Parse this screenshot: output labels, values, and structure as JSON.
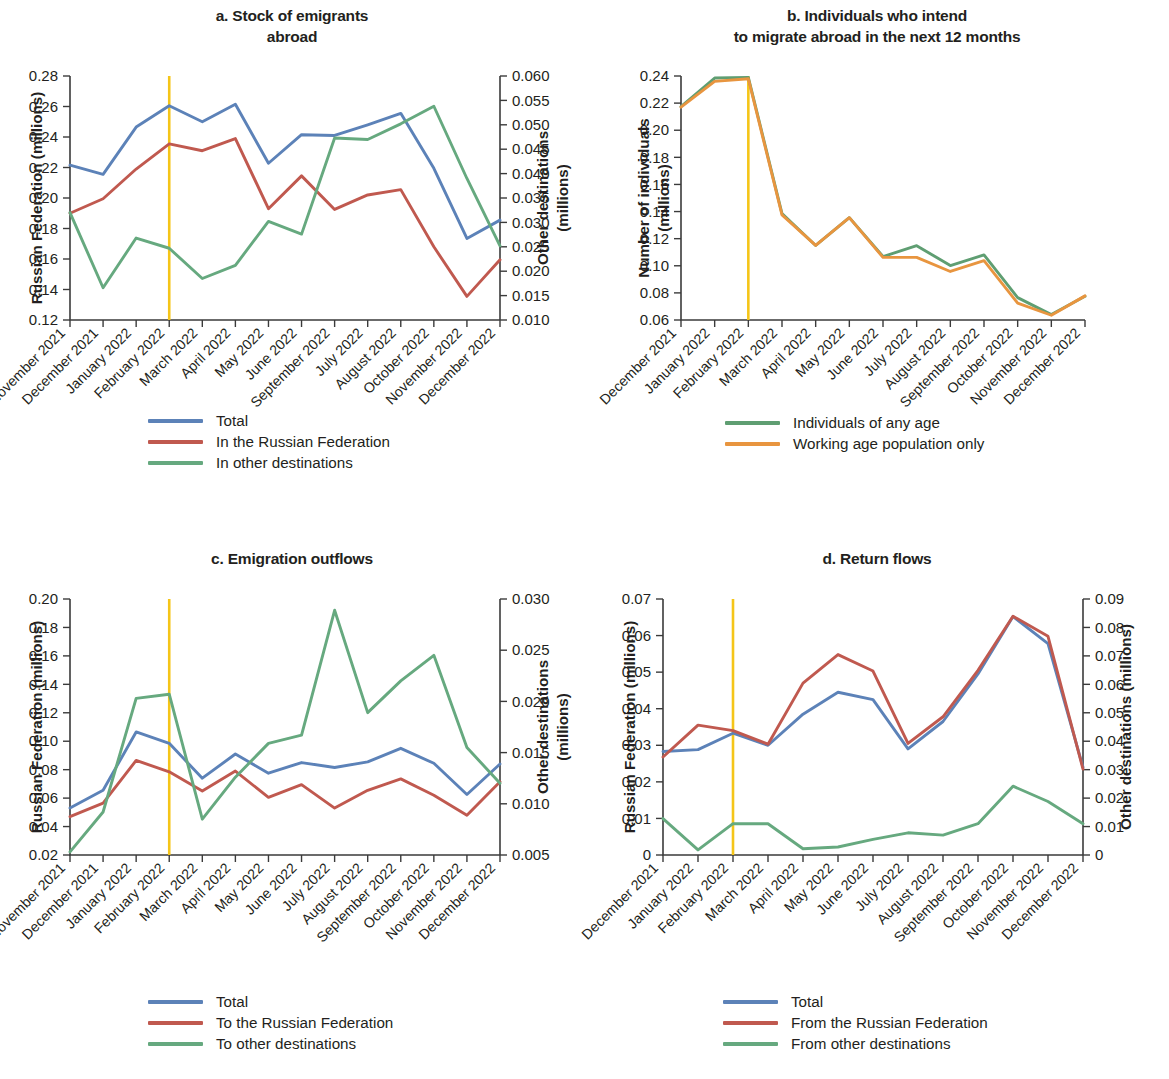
{
  "figure": {
    "background": "#ffffff",
    "colors": {
      "total_blue": "#5c82b8",
      "russia_red": "#c0594f",
      "other_green": "#66a97f",
      "any_age_green": "#5f9e72",
      "working_age_orange": "#e8953f",
      "event_marker_yellow": "#f5c518",
      "axis": "#3b3b3b",
      "text": "#231f20"
    }
  },
  "panels": [
    {
      "id": "a",
      "title": "a. Stock of emigrants\nabroad",
      "title_lines": [
        "a. Stock of emigrants",
        "abroad"
      ],
      "left_axis_title": "Russian Federation (millions)",
      "right_axis_title": "Other destinations\n(millions)",
      "right_axis_title_lines": [
        "Other destinations",
        "(millions)"
      ],
      "legend": [
        {
          "label": "Total",
          "color": "#5c82b8"
        },
        {
          "label": "In the Russian Federation",
          "color": "#c0594f"
        },
        {
          "label": "In other destinations",
          "color": "#66a97f"
        }
      ]
    },
    {
      "id": "b",
      "title": "b. Individuals who intend\nto migrate abroad in the next 12 months",
      "title_lines": [
        "b. Individuals who intend",
        "to migrate abroad in the next 12 months"
      ],
      "left_axis_title": "Number of individuals\n(millions)",
      "left_axis_title_lines": [
        "Number of individuals",
        "(millions)"
      ],
      "legend": [
        {
          "label": "Individuals of any age",
          "color": "#5f9e72"
        },
        {
          "label": "Working age population only",
          "color": "#e8953f"
        }
      ]
    },
    {
      "id": "c",
      "title": "c. Emigration outflows",
      "title_lines": [
        "c. Emigration outflows"
      ],
      "left_axis_title": "Russian Federation (millions)",
      "right_axis_title": "Other destinations\n(millions)",
      "right_axis_title_lines": [
        "Other destinations",
        "(millions)"
      ],
      "legend": [
        {
          "label": "Total",
          "color": "#5c82b8"
        },
        {
          "label": "To the Russian Federation",
          "color": "#c0594f"
        },
        {
          "label": "To other destinations",
          "color": "#66a97f"
        }
      ]
    },
    {
      "id": "d",
      "title": "d. Return flows",
      "title_lines": [
        "d. Return flows"
      ],
      "left_axis_title": "Russian Federation (millions)",
      "right_axis_title": "Other destinations (millions)",
      "right_axis_title_lines": [
        "Other destinations (millions)"
      ],
      "legend": [
        {
          "label": "Total",
          "color": "#5c82b8"
        },
        {
          "label": "From the Russian Federation",
          "color": "#c0594f"
        },
        {
          "label": "From other destinations",
          "color": "#66a97f"
        }
      ]
    }
  ],
  "chart_data": [
    {
      "panel": "a",
      "type": "line",
      "title": "a. Stock of emigrants abroad",
      "xlabel": "",
      "ylabel": "Russian Federation (millions)",
      "y2label": "Other destinations (millions)",
      "ylim": [
        0.12,
        0.28
      ],
      "yticks": [
        "0.12",
        "0.14",
        "0.16",
        "0.18",
        "0.20",
        "0.22",
        "0.24",
        "0.26",
        "0.28"
      ],
      "y2lim": [
        0.01,
        0.06
      ],
      "y2ticks": [
        "0.010",
        "0.015",
        "0.020",
        "0.025",
        "0.030",
        "0.035",
        "0.040",
        "0.045",
        "0.050",
        "0.055",
        "0.060"
      ],
      "grid": false,
      "legend_position": "below-left",
      "categories": [
        "November 2021",
        "December 2021",
        "January 2022",
        "February 2022",
        "March 2022",
        "April 2022",
        "May 2022",
        "June 2022",
        "September 2022",
        "July 2022",
        "August 2022",
        "October 2022",
        "November 2022",
        "December 2022"
      ],
      "annotations": [
        {
          "type": "vertical-line",
          "at_category": "February 2022",
          "color": "#f5c518"
        }
      ],
      "series": [
        {
          "name": "Total",
          "axis": "left",
          "color": "#5c82b8",
          "values": [
            0.2215,
            0.2155,
            0.2465,
            0.2605,
            0.25,
            0.2615,
            0.2228,
            0.2415,
            0.241,
            0.248,
            0.2555,
            0.2195,
            0.1735,
            0.1855
          ]
        },
        {
          "name": "In the Russian Federation",
          "axis": "left",
          "color": "#c0594f",
          "values": [
            0.19,
            0.1995,
            0.219,
            0.2355,
            0.231,
            0.239,
            0.193,
            0.2145,
            0.1925,
            0.202,
            0.2055,
            0.168,
            0.1355,
            0.1595
          ]
        },
        {
          "name": "In other destinations",
          "axis": "right",
          "color": "#66a97f",
          "values": [
            0.032,
            0.0166,
            0.0268,
            0.0247,
            0.0185,
            0.0212,
            0.0302,
            0.0276,
            0.0473,
            0.047,
            0.0502,
            0.0538,
            0.039,
            0.0252
          ]
        }
      ]
    },
    {
      "panel": "b",
      "type": "line",
      "title": "b. Individuals who intend to migrate abroad in the next 12 months",
      "xlabel": "",
      "ylabel": "Number of individuals (millions)",
      "ylim": [
        0.06,
        0.24
      ],
      "yticks": [
        "0.06",
        "0.08",
        "0.10",
        "0.12",
        "0.14",
        "0.16",
        "0.18",
        "0.20",
        "0.22",
        "0.24"
      ],
      "grid": false,
      "legend_position": "below-left",
      "categories": [
        "December 2021",
        "January 2022",
        "February 2022",
        "March 2022",
        "April 2022",
        "May 2022",
        "June 2022",
        "July 2022",
        "August 2022",
        "September 2022",
        "October 2022",
        "November 2022",
        "December 2022"
      ],
      "annotations": [
        {
          "type": "vertical-line",
          "at_category": "February 2022",
          "color": "#f5c518"
        }
      ],
      "series": [
        {
          "name": "Individuals of any age",
          "axis": "left",
          "color": "#5f9e72",
          "values": [
            0.2175,
            0.2385,
            0.239,
            0.1385,
            0.115,
            0.1355,
            0.1068,
            0.1148,
            0.1002,
            0.108,
            0.0765,
            0.064,
            0.0775
          ]
        },
        {
          "name": "Working age population only",
          "axis": "left",
          "color": "#e8953f",
          "values": [
            0.217,
            0.236,
            0.238,
            0.1375,
            0.115,
            0.1355,
            0.1062,
            0.1062,
            0.0958,
            0.1038,
            0.0725,
            0.0635,
            0.0778
          ]
        }
      ]
    },
    {
      "panel": "c",
      "type": "line",
      "title": "c. Emigration outflows",
      "xlabel": "",
      "ylabel": "Russian Federation (millions)",
      "y2label": "Other destinations (millions)",
      "ylim": [
        0.02,
        0.2
      ],
      "yticks": [
        "0.02",
        "0.04",
        "0.06",
        "0.08",
        "0.10",
        "0.12",
        "0.14",
        "0.16",
        "0.18",
        "0.20"
      ],
      "y2lim": [
        0.005,
        0.03
      ],
      "y2ticks": [
        "0.005",
        "0.010",
        "0.015",
        "0.020",
        "0.025",
        "0.030"
      ],
      "grid": false,
      "legend_position": "below-left",
      "categories": [
        "November 2021",
        "December 2021",
        "January 2022",
        "February 2022",
        "March 2022",
        "April 2022",
        "May 2022",
        "June 2022",
        "July 2022",
        "August 2022",
        "September 2022",
        "October 2022",
        "November 2022",
        "December 2022"
      ],
      "annotations": [
        {
          "type": "vertical-line",
          "at_category": "February 2022",
          "color": "#f5c518"
        }
      ],
      "series": [
        {
          "name": "Total",
          "axis": "left",
          "color": "#5c82b8",
          "values": [
            0.053,
            0.0655,
            0.1065,
            0.0985,
            0.074,
            0.091,
            0.0775,
            0.085,
            0.0815,
            0.0855,
            0.095,
            0.0845,
            0.0625,
            0.084
          ]
        },
        {
          "name": "To the Russian Federation",
          "axis": "left",
          "color": "#c0594f",
          "values": [
            0.047,
            0.0565,
            0.0865,
            0.0785,
            0.065,
            0.079,
            0.0605,
            0.0695,
            0.053,
            0.0655,
            0.0735,
            0.062,
            0.048,
            0.0715
          ]
        },
        {
          "name": "To other destinations",
          "axis": "right",
          "color": "#66a97f",
          "values": [
            0.0053,
            0.0092,
            0.0203,
            0.0207,
            0.0085,
            0.0126,
            0.0159,
            0.0167,
            0.0289,
            0.0189,
            0.022,
            0.0245,
            0.0155,
            0.012
          ]
        }
      ]
    },
    {
      "panel": "d",
      "type": "line",
      "title": "d. Return flows",
      "xlabel": "",
      "ylabel": "Russian Federation (millions)",
      "y2label": "Other destinations (millions)",
      "ylim": [
        0,
        0.07
      ],
      "yticks": [
        "0",
        "0.01",
        "0.02",
        "0.03",
        "0.04",
        "0.05",
        "0.06",
        "0.07"
      ],
      "y2lim": [
        0,
        0.09
      ],
      "y2ticks": [
        "0",
        "0.01",
        "0.02",
        "0.03",
        "0.04",
        "0.05",
        "0.06",
        "0.07",
        "0.08",
        "0.09"
      ],
      "grid": false,
      "legend_position": "below-left",
      "categories": [
        "December 2021",
        "January 2022",
        "February 2022",
        "March 2022",
        "April 2022",
        "May 2022",
        "June 2022",
        "July 2022",
        "August 2022",
        "September 2022",
        "October 2022",
        "November 2022",
        "December 2022"
      ],
      "annotations": [
        {
          "type": "vertical-line",
          "at_category": "February 2022",
          "color": "#f5c518"
        }
      ],
      "series": [
        {
          "name": "Total",
          "axis": "left",
          "color": "#5c82b8",
          "values": [
            0.0283,
            0.0288,
            0.0333,
            0.03,
            0.0385,
            0.0445,
            0.0425,
            0.029,
            0.0365,
            0.0495,
            0.0652,
            0.0578,
            0.024
          ]
        },
        {
          "name": "From the Russian Federation",
          "axis": "left",
          "color": "#c0594f",
          "values": [
            0.0268,
            0.0355,
            0.034,
            0.0303,
            0.047,
            0.0548,
            0.0503,
            0.0305,
            0.0378,
            0.0505,
            0.0653,
            0.0598,
            0.0235
          ]
        },
        {
          "name": "From other destinations",
          "axis": "right",
          "color": "#66a97f",
          "values": [
            0.0128,
            0.0018,
            0.011,
            0.011,
            0.0022,
            0.0028,
            0.0055,
            0.0078,
            0.007,
            0.011,
            0.0242,
            0.0188,
            0.011
          ]
        }
      ]
    }
  ]
}
